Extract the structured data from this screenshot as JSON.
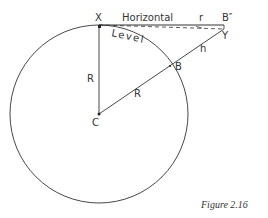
{
  "figure": {
    "caption": "Figure 2.16",
    "points": {
      "X": "X",
      "B_double_prime": "B″",
      "Y": "Y",
      "B": "B",
      "C": "C"
    },
    "labels": {
      "horizontal": "Horizontal",
      "level": "Level",
      "radius_vertical": "R",
      "radius_diagonal": "R",
      "refraction": "r",
      "height": "h"
    },
    "colors": {
      "line": "#333333",
      "background": "#ffffff"
    }
  }
}
